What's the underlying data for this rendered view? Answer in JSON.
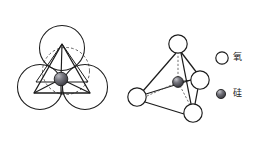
{
  "figure": {
    "title": "",
    "background_color": "#ffffff",
    "width": 254,
    "height": 143
  },
  "legend": {
    "entries": [
      {
        "label": "氧",
        "meaning": "oxygen",
        "marker": "open-circle",
        "marker_fill": "#ffffff",
        "marker_stroke": "#1c1c1c",
        "cx": 222,
        "cy": 58,
        "r": 6.2
      },
      {
        "label": "硅",
        "meaning": "silicon",
        "marker": "shaded-sphere",
        "marker_fill": "#55555a",
        "marker_stroke": "#1c1c1c",
        "cx": 221,
        "cy": 94,
        "r": 4.6
      }
    ]
  },
  "left_diagram": {
    "name": "packed-sphere-top-view",
    "oxygen_circles": [
      {
        "cx": 62,
        "cy": 48,
        "r": 22.5
      },
      {
        "cx": 40,
        "cy": 87,
        "r": 22.5
      },
      {
        "cx": 85,
        "cy": 87,
        "r": 22.5
      }
    ],
    "dashed_circle": {
      "cx": 66,
      "cy": 71,
      "r": 23.5
    },
    "triangle_points": "62,44 34,93 90,93",
    "inner_triangle_points": "62,44 40,79 86,80",
    "silicon_center": {
      "cx": 61,
      "cy": 79,
      "r": 6.8
    },
    "bonds": [
      {
        "x1": 61,
        "y1": 79,
        "x2": 62,
        "y2": 44
      },
      {
        "x1": 61,
        "y1": 79,
        "x2": 34,
        "y2": 93
      },
      {
        "x1": 61,
        "y1": 79,
        "x2": 90,
        "y2": 93
      },
      {
        "x1": 61,
        "y1": 79,
        "x2": 61,
        "y2": 95
      }
    ]
  },
  "right_diagram": {
    "name": "tetrahedron-3d-view",
    "oxygen_vertices": [
      {
        "id": "top",
        "cx": 178,
        "cy": 44,
        "r": 9.2
      },
      {
        "id": "left",
        "cx": 137,
        "cy": 97,
        "r": 9.2
      },
      {
        "id": "right",
        "cx": 200,
        "cy": 80,
        "r": 9.2
      },
      {
        "id": "bottom",
        "cx": 193,
        "cy": 113,
        "r": 9.2
      }
    ],
    "silicon_center": {
      "cx": 178,
      "cy": 82,
      "r": 5.4
    },
    "solid_edges": [
      {
        "x1": 178,
        "y1": 53,
        "x2": 145,
        "y2": 92
      },
      {
        "x1": 178,
        "y1": 53,
        "x2": 196,
        "y2": 73
      },
      {
        "x1": 178,
        "y1": 53,
        "x2": 190,
        "y2": 104
      },
      {
        "x1": 146,
        "y1": 101,
        "x2": 184,
        "y2": 114
      },
      {
        "x1": 196,
        "y1": 87,
        "x2": 194,
        "y2": 104
      },
      {
        "x1": 146,
        "y1": 94,
        "x2": 191,
        "y2": 79
      }
    ],
    "dashed_bonds": [
      {
        "x1": 178,
        "y1": 82,
        "x2": 178,
        "y2": 53
      },
      {
        "x1": 178,
        "y1": 82,
        "x2": 146,
        "y2": 96
      },
      {
        "x1": 178,
        "y1": 82,
        "x2": 190,
        "y2": 106
      }
    ],
    "solid_bonds": [
      {
        "x1": 178,
        "y1": 82,
        "x2": 191,
        "y2": 80
      }
    ]
  },
  "colors": {
    "stroke": "#1c1c1c",
    "fill_white": "#ffffff",
    "silicon_dark": "#4a4a50",
    "silicon_mid": "#6e6e75",
    "dashed": "#3a3a3a"
  }
}
